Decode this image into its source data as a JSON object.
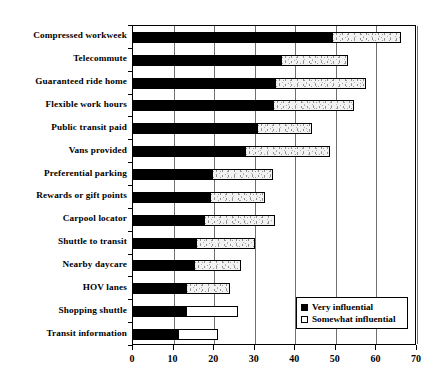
{
  "chart_data": {
    "type": "bar",
    "orientation": "horizontal",
    "stacked": true,
    "title": "",
    "subtitle": "",
    "xlabel": "",
    "ylabel": "",
    "xlim": [
      0,
      70
    ],
    "xticks": [
      0,
      10,
      20,
      30,
      40,
      50,
      60,
      70
    ],
    "xtick_labels": [
      "0",
      "10",
      "20",
      "30",
      "40",
      "50",
      "60",
      "70"
    ],
    "grid": "vertical",
    "legend_position": "bottom-right",
    "categories": [
      "Compressed workweek",
      "Telecommute",
      "Guaranteed ride home",
      "Flexible work hours",
      "Public transit paid",
      "Vans provided",
      "Preferential parking",
      "Rewards or gift points",
      "Carpool locator",
      "Shuttle to transit",
      "Nearby daycare",
      "HOV lanes",
      "Shopping shuttle",
      "Transit information"
    ],
    "series": [
      {
        "name": "Very influential",
        "color": "#000000",
        "values": [
          49,
          36.5,
          35,
          34.5,
          30.5,
          27.5,
          19.5,
          19,
          17.5,
          15.5,
          15,
          13,
          13,
          11
        ]
      },
      {
        "name": "Somewhat influential",
        "color": "#f2f2f2",
        "values": [
          17,
          16.5,
          22.5,
          20,
          13.5,
          21,
          15,
          13.5,
          17.5,
          14.5,
          11.5,
          11,
          13,
          10
        ]
      }
    ],
    "totals": [
      66,
      53,
      57.5,
      54.5,
      44,
      48.5,
      34.5,
      32.5,
      35,
      30,
      26.5,
      24,
      26,
      21
    ]
  },
  "legend": {
    "items": [
      {
        "label": "Very influential",
        "swatch": "filled"
      },
      {
        "label": "Somewhat influential",
        "swatch": "hollow"
      }
    ]
  }
}
